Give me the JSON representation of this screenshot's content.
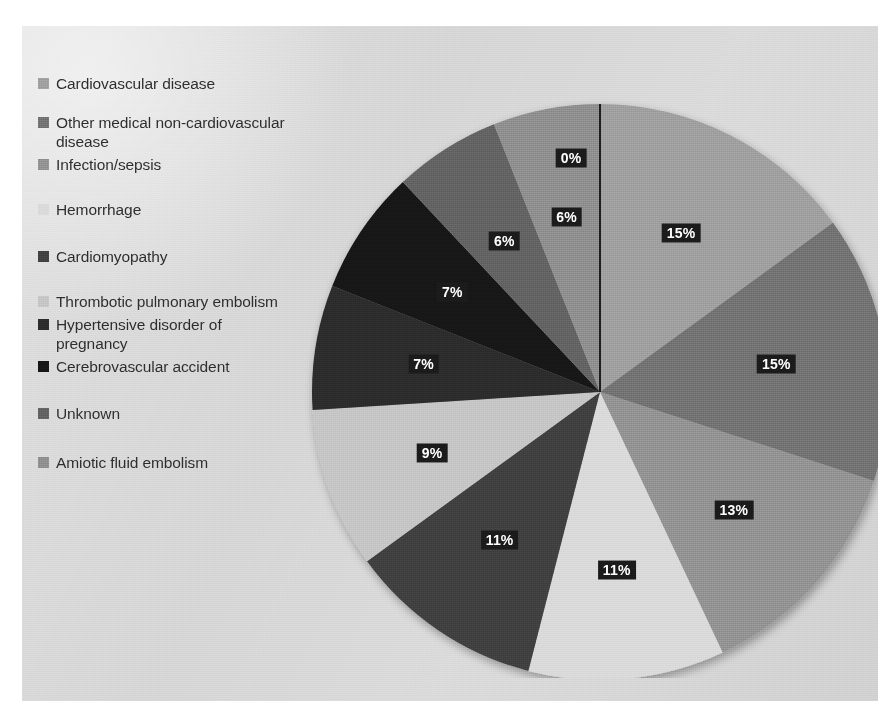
{
  "chart_data": {
    "type": "pie",
    "title": "",
    "subtitle": "",
    "xlabel": "",
    "ylabel": "",
    "legend_position": "left",
    "grid": false,
    "value_unit": "%",
    "categories": [
      "Cardiovascular disease",
      "Other medical non-cardiovascular disease",
      "Infection/sepsis",
      "Hemorrhage",
      "Cardiomyopathy",
      "Thrombotic pulmonary embolism",
      "Hypertensive disorder of pregnancy",
      "Cerebrovascular accident",
      "Unknown",
      "Amiotic fluid embolism"
    ],
    "values": [
      15,
      15,
      13,
      11,
      11,
      9,
      7,
      7,
      6,
      6
    ],
    "data_labels": [
      "15%",
      "15%",
      "13%",
      "11%",
      "11%",
      "9%",
      "7%",
      "7%",
      "6%",
      "6%"
    ],
    "extra_labels": [
      {
        "text": "0%",
        "note": "label for the thin sliver at the 12 o'clock start of the pie"
      }
    ],
    "slice_colors": [
      "#9b9b9b",
      "#6e6e6e",
      "#8e8e8e",
      "#d8d8d8",
      "#3e3e3e",
      "#c3c3c3",
      "#2a2a2a",
      "#151515",
      "#5e5e5e",
      "#8a8a8a"
    ],
    "slices": [
      {
        "label": "Cardiovascular disease",
        "value": 15,
        "display": "15%",
        "color": "#9b9b9b"
      },
      {
        "label": "Other medical non-cardiovascular disease",
        "value": 15,
        "display": "15%",
        "color": "#6e6e6e"
      },
      {
        "label": "Infection/sepsis",
        "value": 13,
        "display": "13%",
        "color": "#8e8e8e"
      },
      {
        "label": "Hemorrhage",
        "value": 11,
        "display": "11%",
        "color": "#d8d8d8"
      },
      {
        "label": "Cardiomyopathy",
        "value": 11,
        "display": "11%",
        "color": "#3e3e3e"
      },
      {
        "label": "Thrombotic pulmonary embolism",
        "value": 9,
        "display": "9%",
        "color": "#c3c3c3"
      },
      {
        "label": "Hypertensive disorder of pregnancy",
        "value": 7,
        "display": "7%",
        "color": "#2a2a2a"
      },
      {
        "label": "Cerebrovascular accident",
        "value": 7,
        "display": "7%",
        "color": "#151515"
      },
      {
        "label": "Unknown",
        "value": 6,
        "display": "6%",
        "color": "#5e5e5e"
      },
      {
        "label": "Amiotic fluid embolism",
        "value": 6,
        "display": "6%",
        "color": "#8a8a8a"
      }
    ]
  },
  "legend": {
    "items": [
      {
        "label": "Cardiovascular disease",
        "color": "#9b9b9b",
        "gap_after": 20
      },
      {
        "label": "Other medical non-cardiovascular disease",
        "color": "#6e6e6e",
        "gap_after": 4
      },
      {
        "label": "Infection/sepsis",
        "color": "#8e8e8e",
        "gap_after": 26
      },
      {
        "label": "Hemorrhage",
        "color": "#d8d8d8",
        "gap_after": 28
      },
      {
        "label": "Cardiomyopathy",
        "color": "#3e3e3e",
        "gap_after": 26
      },
      {
        "label": "Thrombotic pulmonary embolism",
        "color": "#c3c3c3",
        "gap_after": 4
      },
      {
        "label": "Hypertensive disorder of pregnancy",
        "color": "#2a2a2a",
        "gap_after": 4
      },
      {
        "label": "Cerebrovascular accident",
        "color": "#151515",
        "gap_after": 28
      },
      {
        "label": "Unknown",
        "color": "#5e5e5e",
        "gap_after": 30
      },
      {
        "label": "Amiotic fluid embolism",
        "color": "#8a8a8a",
        "gap_after": 0
      }
    ]
  },
  "pie_geometry": {
    "center_x": 310,
    "center_y": 314,
    "radius": 288,
    "start_angle_deg": 0,
    "direction": "clockwise",
    "label_radius_fraction": 0.62
  },
  "callouts": [
    {
      "name": "zero-percent-label",
      "text": "0%",
      "x": 281,
      "y": 80
    }
  ]
}
